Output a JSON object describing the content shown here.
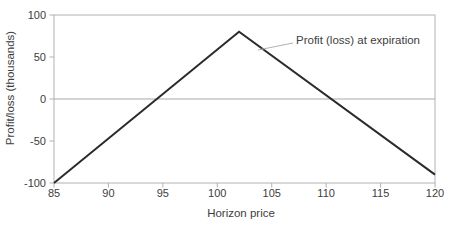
{
  "chart_data": {
    "type": "line",
    "title": "",
    "xlabel": "Horizon price",
    "ylabel": "Profit/loss (thousands)",
    "xlim": [
      85,
      120
    ],
    "ylim": [
      -100,
      100
    ],
    "x_ticks": [
      85,
      90,
      95,
      100,
      105,
      110,
      115,
      120
    ],
    "y_ticks": [
      100,
      50,
      0,
      -50,
      -100
    ],
    "grid": false,
    "zero_line": true,
    "legend_position": "none",
    "series": [
      {
        "name": "Profit (loss) at expiration",
        "points": [
          [
            85,
            -100
          ],
          [
            102,
            80
          ],
          [
            120,
            -90
          ]
        ]
      }
    ],
    "annotations": [
      {
        "text": "Profit (loss) at expiration",
        "anchor_price": 104,
        "anchor_value": 57
      }
    ]
  },
  "colors": {
    "background": "#ffffff",
    "frame": "#b2b2b2",
    "zero_line": "#a8a8a8",
    "series": "#2b2b2b",
    "leader": "#b2b2b2",
    "text": "#3d3d3d"
  }
}
